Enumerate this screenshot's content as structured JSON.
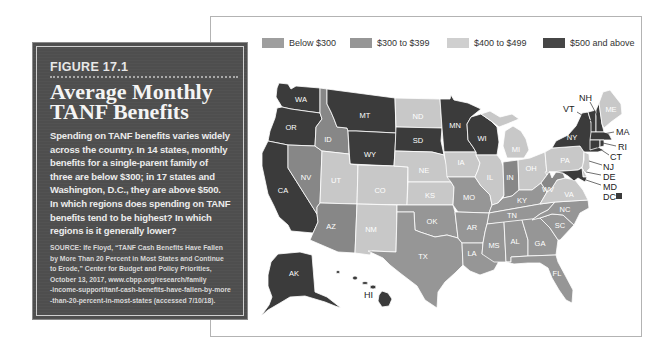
{
  "figure": {
    "label": "FIGURE 17.1",
    "title_lines": [
      "Average Monthly",
      "TANF Benefits"
    ],
    "body_lines": [
      "Spending on TANF benefits varies widely",
      "across the country. In 14 states, monthly",
      "benefits for a single-parent family of",
      "three are below $300; in 17 states and",
      "Washington, D.C., they are above $500.",
      "In which regions does spending on TANF",
      "benefits tend to be highest? In which",
      "regions is it generally lower?"
    ],
    "source_lines": [
      "SOURCE: Ife Floyd, “TANF Cash Benefits Have Fallen",
      "by More Than 20 Percent in Most States and Continue",
      "to Erode,” Center for Budget and Policy Priorities,",
      "October 13, 2017, www.cbpp.org/research/family",
      "-income-support/tanf-cash-benefits-have-fallen-by-more",
      "-than-20-percent-in-most-states (accessed 7/10/18)."
    ]
  },
  "legend": [
    {
      "label": "Below $300",
      "color": "#969696"
    },
    {
      "label": "$300 to $399",
      "color": "#878787"
    },
    {
      "label": "$400 to $499",
      "color": "#c8c8c8"
    },
    {
      "label": "$500 and above",
      "color": "#3b3b3b"
    }
  ],
  "map": {
    "states": {
      "WA": {
        "label": "WA",
        "category": "$500 and above",
        "fill": "#3b3b3b"
      },
      "OR": {
        "label": "OR",
        "category": "$500 and above",
        "fill": "#3b3b3b"
      },
      "CA": {
        "label": "CA",
        "category": "$500 and above",
        "fill": "#3b3b3b"
      },
      "MT": {
        "label": "MT",
        "category": "$500 and above",
        "fill": "#3b3b3b"
      },
      "WY": {
        "label": "WY",
        "category": "$500 and above",
        "fill": "#3b3b3b"
      },
      "SD": {
        "label": "SD",
        "category": "$500 and above",
        "fill": "#3b3b3b"
      },
      "MN": {
        "label": "MN",
        "category": "$500 and above",
        "fill": "#3b3b3b"
      },
      "WI": {
        "label": "WI",
        "category": "$500 and above",
        "fill": "#3b3b3b"
      },
      "AK": {
        "label": "AK",
        "category": "$500 and above",
        "fill": "#3b3b3b"
      },
      "HI": {
        "label": "HI",
        "category": "$500 and above",
        "fill": "#3b3b3b"
      },
      "NY": {
        "label": "NY",
        "category": "$500 and above",
        "fill": "#3b3b3b"
      },
      "VT": {
        "label": "VT",
        "category": "$500 and above",
        "fill": "#3b3b3b"
      },
      "NH": {
        "label": "NH",
        "category": "$500 and above",
        "fill": "#3b3b3b"
      },
      "MA": {
        "label": "MA",
        "category": "$500 and above",
        "fill": "#3b3b3b"
      },
      "RI": {
        "label": "RI",
        "category": "$500 and above",
        "fill": "#3b3b3b"
      },
      "CT": {
        "label": "CT",
        "category": "$500 and above",
        "fill": "#3b3b3b"
      },
      "MD": {
        "label": "MD",
        "category": "$500 and above",
        "fill": "#3b3b3b"
      },
      "DC": {
        "label": "DC",
        "category": "$500 and above",
        "fill": "#3b3b3b"
      },
      "ND": {
        "label": "ND",
        "category": "$400 to $499",
        "fill": "#c8c8c8"
      },
      "NE": {
        "label": "NE",
        "category": "$400 to $499",
        "fill": "#c8c8c8"
      },
      "UT": {
        "label": "UT",
        "category": "$400 to $499",
        "fill": "#c8c8c8"
      },
      "CO": {
        "label": "CO",
        "category": "$400 to $499",
        "fill": "#c8c8c8"
      },
      "NM": {
        "label": "NM",
        "category": "$400 to $499",
        "fill": "#c8c8c8"
      },
      "KS": {
        "label": "KS",
        "category": "$400 to $499",
        "fill": "#c8c8c8"
      },
      "IA": {
        "label": "IA",
        "category": "$400 to $499",
        "fill": "#c8c8c8"
      },
      "IL": {
        "label": "IL",
        "category": "$400 to $499",
        "fill": "#c8c8c8"
      },
      "MI": {
        "label": "MI",
        "category": "$400 to $499",
        "fill": "#c8c8c8"
      },
      "OH": {
        "label": "OH",
        "category": "$400 to $499",
        "fill": "#c8c8c8"
      },
      "PA": {
        "label": "PA",
        "category": "$400 to $499",
        "fill": "#c8c8c8"
      },
      "ME": {
        "label": "ME",
        "category": "$400 to $499",
        "fill": "#c8c8c8"
      },
      "NJ": {
        "label": "NJ",
        "category": "$400 to $499",
        "fill": "#c8c8c8"
      },
      "DE": {
        "label": "DE",
        "category": "$400 to $499",
        "fill": "#c8c8c8"
      },
      "VA": {
        "label": "VA",
        "category": "$400 to $499",
        "fill": "#c8c8c8"
      },
      "ID": {
        "label": "ID",
        "category": "$300 to $399",
        "fill": "#878787"
      },
      "NV": {
        "label": "NV",
        "category": "$300 to $399",
        "fill": "#878787"
      },
      "AZ": {
        "label": "AZ",
        "category": "$300 to $399",
        "fill": "#878787"
      },
      "IN": {
        "label": "IN",
        "category": "$300 to $399",
        "fill": "#878787"
      },
      "WV": {
        "label": "WV",
        "category": "$300 to $399",
        "fill": "#878787"
      },
      "TX": {
        "label": "TX",
        "category": "Below $300",
        "fill": "#969696"
      },
      "OK": {
        "label": "OK",
        "category": "Below $300",
        "fill": "#969696"
      },
      "MO": {
        "label": "MO",
        "category": "Below $300",
        "fill": "#969696"
      },
      "AR": {
        "label": "AR",
        "category": "Below $300",
        "fill": "#969696"
      },
      "LA": {
        "label": "LA",
        "category": "Below $300",
        "fill": "#969696"
      },
      "MS": {
        "label": "MS",
        "category": "Below $300",
        "fill": "#969696"
      },
      "AL": {
        "label": "AL",
        "category": "Below $300",
        "fill": "#969696"
      },
      "GA": {
        "label": "GA",
        "category": "Below $300",
        "fill": "#969696"
      },
      "FL": {
        "label": "FL",
        "category": "Below $300",
        "fill": "#969696"
      },
      "TN": {
        "label": "TN",
        "category": "Below $300",
        "fill": "#969696"
      },
      "KY": {
        "label": "KY",
        "category": "Below $300",
        "fill": "#969696"
      },
      "SC": {
        "label": "SC",
        "category": "Below $300",
        "fill": "#969696"
      },
      "NC": {
        "label": "NC",
        "category": "Below $300",
        "fill": "#969696"
      }
    }
  }
}
